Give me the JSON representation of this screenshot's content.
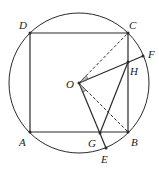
{
  "diagram": {
    "type": "geometry",
    "stroke_color": "#2a2a2a",
    "circle": {
      "center": "O",
      "cx": 79,
      "cy": 83,
      "r": 70
    },
    "points": {
      "A": {
        "label": "A",
        "x": 30,
        "y": 132,
        "lx": 19,
        "ly": 146
      },
      "B": {
        "label": "B",
        "x": 128,
        "y": 132,
        "lx": 131,
        "ly": 146
      },
      "C": {
        "label": "C",
        "x": 128,
        "y": 33,
        "lx": 129,
        "ly": 29
      },
      "D": {
        "label": "D",
        "x": 30,
        "y": 33,
        "lx": 19,
        "ly": 29
      },
      "O": {
        "label": "O",
        "x": 79,
        "y": 83,
        "lx": 66,
        "ly": 88
      },
      "F": {
        "label": "F",
        "x": 143,
        "y": 56,
        "lx": 148,
        "ly": 58
      },
      "H": {
        "label": "H",
        "x": 128,
        "y": 62,
        "lx": 130,
        "ly": 75
      },
      "G": {
        "label": "G",
        "x": 100,
        "y": 133,
        "lx": 88,
        "ly": 147
      },
      "E": {
        "label": "E",
        "x": 106,
        "y": 148,
        "lx": 101,
        "ly": 163
      }
    },
    "solid_segments": [
      "AB",
      "BC",
      "CD",
      "DA",
      "OF",
      "OE",
      "GH"
    ],
    "dashed_segments": [
      "OC",
      "OB"
    ],
    "angle_marks": [
      "angle COF at O",
      "angle BOE at O"
    ]
  }
}
